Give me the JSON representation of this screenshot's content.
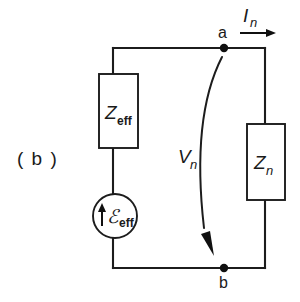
{
  "figure": {
    "panel_label": "( b )",
    "caption_type": "circuit-schematic",
    "background_color": "#ffffff",
    "line_color": "#1c1c1c"
  },
  "components": {
    "source_impedance": {
      "symbol": "Z",
      "subscript": "eff",
      "shape": "rectangle",
      "name": "effective impedance"
    },
    "load_impedance": {
      "symbol": "Z",
      "subscript": "n",
      "shape": "rectangle",
      "name": "load impedance"
    },
    "emf_source": {
      "symbol": "ℰ",
      "subscript": "eff",
      "shape": "circle",
      "polarity_arrow": "up",
      "name": "effective emf source"
    }
  },
  "labels": {
    "terminal_a": "a",
    "terminal_b": "b",
    "current": {
      "symbol": "I",
      "subscript": "n",
      "arrow_direction": "right"
    },
    "voltage": {
      "symbol": "V",
      "subscript": "n",
      "arrow_direction": "down",
      "arrow_style": "curved"
    }
  },
  "icons": {
    "current_arrow": "arrow-right-icon",
    "voltage_arrow": "curved-arrow-down-icon",
    "emf_polarity_arrow": "arrow-up-icon",
    "node_a": "junction-dot-icon",
    "node_b": "junction-dot-icon"
  }
}
